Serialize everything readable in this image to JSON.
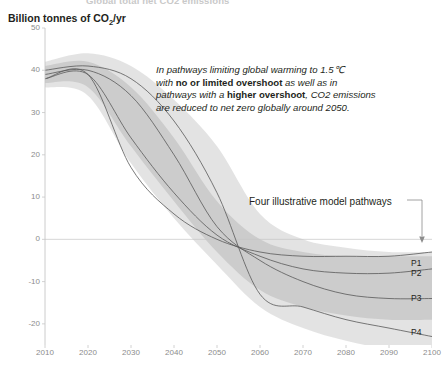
{
  "figure": {
    "supertitle": "Global total net CO2 emissions",
    "unit_label_text": "Billion tonnes of CO",
    "unit_label_sub": "2",
    "unit_label_suffix": "/yr"
  },
  "annotation": {
    "line1_a": "In pathways limiting global warming to 1.5",
    "line1_b": "℃",
    "line2_a": "with ",
    "line2_bold": "no or limited overshoot",
    "line2_b": " as well as in",
    "line3_a": "pathways with a ",
    "line3_bold": "higher overshoot",
    "line3_b": ", CO2 emissions",
    "line4": "are reduced to net zero globally around 2050."
  },
  "callout": {
    "label": "Four illustrative model pathways"
  },
  "pathway_labels": [
    {
      "name": "P1",
      "y": 258
    },
    {
      "name": "P2",
      "y": 268
    },
    {
      "name": "P3",
      "y": 293
    },
    {
      "name": "P4",
      "y": 327
    }
  ],
  "colors": {
    "axis": "#c6c6c6",
    "tick_text": "#8c8c8c",
    "line": "#5a5a5a",
    "band_outer": "#d9d9d9",
    "band_inner": "#bdbdbd",
    "text": "#231f20",
    "background": "#ffffff"
  },
  "chart_data": {
    "type": "line",
    "title": "Global total net CO2 emissions",
    "xlabel": "",
    "ylabel": "Billion tonnes of CO2/yr",
    "xlim": [
      2010,
      2100
    ],
    "ylim": [
      -25,
      50
    ],
    "yticks": [
      50,
      40,
      30,
      20,
      10,
      0,
      -10,
      -20
    ],
    "xticks": [
      2010,
      2020,
      2030,
      2040,
      2050,
      2060,
      2070,
      2080,
      2090,
      2100
    ],
    "grid": false,
    "zero_line": true,
    "legend_position": "right-labels",
    "x": [
      2010,
      2020,
      2030,
      2040,
      2050,
      2060,
      2070,
      2080,
      2090,
      2100
    ],
    "series": [
      {
        "name": "P1",
        "values": [
          38,
          39,
          17,
          6,
          0,
          -3,
          -4,
          -4,
          -4,
          -3
        ]
      },
      {
        "name": "P2",
        "values": [
          38,
          39,
          24,
          11,
          1,
          -4,
          -7,
          -8,
          -8,
          -7
        ]
      },
      {
        "name": "P3",
        "values": [
          39,
          40,
          34,
          20,
          3,
          -5,
          -10,
          -13,
          -14,
          -14
        ]
      },
      {
        "name": "P4",
        "values": [
          40,
          41,
          38,
          28,
          11,
          -13,
          -16,
          -19,
          -21,
          -23
        ]
      }
    ],
    "bands": [
      {
        "name": "higher overshoot range",
        "shade": "#d9d9d9",
        "upper": [
          42,
          44,
          41,
          33,
          22,
          6,
          0,
          -2,
          -3,
          -3
        ],
        "lower": [
          36,
          34,
          18,
          5,
          -6,
          -16,
          -21,
          -24,
          -26,
          -27
        ]
      },
      {
        "name": "no or limited overshoot range",
        "shade": "#bdbdbd",
        "upper": [
          41,
          42,
          36,
          24,
          9,
          0,
          -3,
          -4,
          -4,
          -4
        ],
        "lower": [
          37,
          36,
          22,
          9,
          -3,
          -12,
          -16,
          -18,
          -19,
          -19
        ]
      }
    ],
    "annotations": [
      "In pathways limiting global warming to 1.5℃ with no or limited overshoot as well as in pathways with a higher overshoot, CO2 emissions are reduced to net zero globally around 2050.",
      "Four illustrative model pathways"
    ]
  }
}
